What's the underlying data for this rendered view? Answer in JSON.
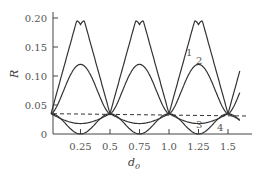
{
  "chart_data": {
    "type": "line",
    "title": "",
    "xlabel": "d_0",
    "ylabel": "R",
    "xlim": [
      0,
      1.7
    ],
    "ylim": [
      0,
      0.2
    ],
    "x_ticks": [
      "0.25",
      "0.5",
      "0.75",
      "1.0",
      "1.25",
      "1.5"
    ],
    "y_ticks": [
      "0",
      "0.05",
      "0.10",
      "0.15",
      "0.20"
    ],
    "grid": false,
    "legend": "curve numbers labeled inline",
    "series": [
      {
        "name": "1",
        "description": "periodic peaks reaching ~0.195 at d0=0.25, 0.75, 1.25; minima ~0.035 at d0=0, 0.5, 1.0, 1.5",
        "x": [
          0,
          0.25,
          0.5,
          0.75,
          1.0,
          1.25,
          1.5
        ],
        "values": [
          0.035,
          0.195,
          0.035,
          0.195,
          0.035,
          0.195,
          0.035
        ]
      },
      {
        "name": "2",
        "description": "periodic peaks ~0.12 at d0=0.25, 0.75, 1.25",
        "x": [
          0,
          0.25,
          0.5,
          0.75,
          1.0,
          1.25,
          1.5
        ],
        "values": [
          0.035,
          0.12,
          0.035,
          0.12,
          0.035,
          0.12,
          0.035
        ]
      },
      {
        "name": "3",
        "description": "dashed horizontal line at ~0.035",
        "x": [
          0,
          1.65
        ],
        "values": [
          0.035,
          0.03
        ]
      },
      {
        "name": "4",
        "description": "periodic minima at d0=0.25, 0.75, 1.25",
        "x": [
          0,
          0.25,
          0.5,
          0.75,
          1.0,
          1.25,
          1.5
        ],
        "values": [
          0.035,
          0.0,
          0.035,
          0.0,
          0.035,
          0.0,
          0.035
        ]
      },
      {
        "name": "shallow",
        "description": "unlabeled solid curve with shallow minima ~0.018",
        "x": [
          0,
          0.25,
          0.5,
          0.75,
          1.0,
          1.25,
          1.5
        ],
        "values": [
          0.035,
          0.018,
          0.035,
          0.018,
          0.035,
          0.018,
          0.035
        ]
      }
    ],
    "annotations": [
      "1",
      "2",
      "3",
      "4"
    ]
  }
}
